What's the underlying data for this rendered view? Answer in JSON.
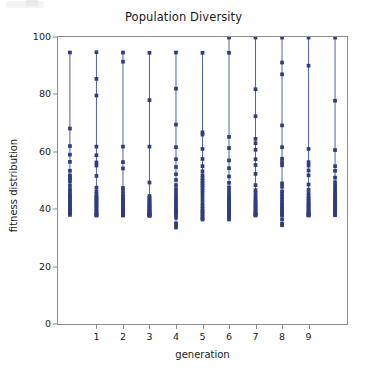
{
  "figure": {
    "width": 367,
    "height": 377,
    "background": "#ffffff",
    "axes_color": "#8c8c8c",
    "text_color": "#1a1a1a"
  },
  "chart_data": {
    "type": "scatter",
    "title": "Population Diversity",
    "xlabel": "generation",
    "ylabel": "fitness distribution",
    "xlim": [
      -0.45,
      10.45
    ],
    "ylim": [
      0,
      100
    ],
    "xticks": [
      1,
      2,
      3,
      4,
      5,
      6,
      7,
      8,
      9
    ],
    "xtick_labels": [
      "1",
      "2",
      "3",
      "4",
      "5",
      "6",
      "7",
      "8",
      "9"
    ],
    "yticks": [
      0,
      20,
      40,
      60,
      80,
      100
    ],
    "ytick_labels": [
      "0",
      "20",
      "40",
      "60",
      "80",
      "100"
    ],
    "grid": false,
    "legend": null,
    "marker_color": "#2f3d80",
    "line_color": "#42508f",
    "marker_size": 2.6,
    "line_width": 0.9,
    "note": "Each generation is drawn as a vertical stem connecting the minimum and maximum fitness, overlaid with one marker per individual in the population.",
    "series": [
      {
        "name": "generation 0",
        "x": 0,
        "clipped": true,
        "values": [
          94.6,
          68.1,
          62.0,
          59.0,
          56.5,
          53.4,
          51.8,
          51.0,
          50.4,
          49.6,
          48.2,
          47.0,
          46.1,
          45.2,
          44.6,
          44.0,
          43.4,
          42.8,
          42.1,
          41.5,
          41.0,
          40.4,
          39.8,
          39.2,
          38.6,
          38.0
        ]
      },
      {
        "name": "generation 1",
        "x": 1,
        "clipped": false,
        "values": [
          94.7,
          85.4,
          79.6,
          61.8,
          58.8,
          56.3,
          55.2,
          51.6,
          47.5,
          46.2,
          45.3,
          44.5,
          44.0,
          43.4,
          42.9,
          42.3,
          41.7,
          41.1,
          40.6,
          40.0,
          39.5,
          39.0,
          38.5,
          38.1,
          37.9,
          37.8
        ]
      },
      {
        "name": "generation 2",
        "x": 2,
        "clipped": false,
        "values": [
          94.6,
          91.4,
          61.8,
          56.4,
          54.2,
          47.4,
          46.3,
          45.2,
          44.4,
          43.8,
          43.2,
          42.6,
          42.1,
          41.6,
          41.1,
          40.6,
          40.2,
          39.8,
          39.4,
          39.0,
          38.7,
          38.4,
          38.2,
          38.0,
          37.9,
          37.8
        ]
      },
      {
        "name": "generation 3",
        "x": 3,
        "clipped": false,
        "values": [
          94.5,
          78.0,
          61.8,
          49.3,
          44.6,
          44.0,
          43.5,
          43.0,
          42.5,
          42.1,
          41.7,
          41.3,
          40.9,
          40.5,
          40.1,
          39.8,
          39.5,
          39.2,
          38.9,
          38.6,
          38.4,
          38.2,
          38.0,
          37.9,
          37.8,
          37.7
        ]
      },
      {
        "name": "generation 4",
        "x": 4,
        "clipped": false,
        "values": [
          94.6,
          82.0,
          69.5,
          61.6,
          57.4,
          54.7,
          52.2,
          50.2,
          48.4,
          47.0,
          45.7,
          44.6,
          43.6,
          42.8,
          42.0,
          41.3,
          40.6,
          40.0,
          39.5,
          39.0,
          38.5,
          38.1,
          37.0,
          35.1,
          34.4,
          33.6
        ]
      },
      {
        "name": "generation 5",
        "x": 5,
        "clipped": false,
        "values": [
          94.5,
          66.8,
          66.0,
          61.0,
          57.5,
          55.0,
          53.2,
          51.8,
          50.8,
          49.9,
          49.1,
          48.3,
          47.5,
          46.6,
          45.6,
          44.4,
          43.2,
          42.0,
          41.0,
          40.1,
          39.4,
          38.8,
          38.2,
          37.4,
          36.8,
          36.4
        ]
      },
      {
        "name": "generation 6",
        "x": 6,
        "clipped": false,
        "values": [
          99.8,
          94.5,
          65.2,
          61.3,
          57.0,
          54.3,
          51.4,
          49.2,
          47.6,
          46.4,
          45.4,
          44.5,
          43.8,
          43.1,
          42.5,
          41.9,
          41.3,
          40.8,
          40.2,
          39.7,
          39.2,
          38.7,
          38.2,
          37.6,
          37.0,
          36.4
        ]
      },
      {
        "name": "generation 7",
        "x": 7,
        "clipped": false,
        "values": [
          99.8,
          81.8,
          72.4,
          64.5,
          63.0,
          60.7,
          57.4,
          55.4,
          52.3,
          48.4,
          46.6,
          45.5,
          44.5,
          43.6,
          42.9,
          42.2,
          41.6,
          41.0,
          40.4,
          39.9,
          39.4,
          38.9,
          38.5,
          38.2,
          38.0,
          37.8
        ]
      },
      {
        "name": "generation 8",
        "x": 8,
        "clipped": false,
        "values": [
          99.8,
          91.1,
          87.0,
          69.2,
          61.6,
          57.6,
          56.4,
          55.3,
          49.0,
          47.8,
          46.2,
          45.2,
          44.3,
          43.4,
          42.5,
          41.7,
          41.0,
          40.3,
          39.7,
          39.1,
          38.6,
          38.2,
          37.9,
          36.5,
          35.0,
          34.4
        ]
      },
      {
        "name": "generation 9",
        "x": 9,
        "clipped": false,
        "values": [
          99.8,
          90.0,
          61.0,
          56.4,
          55.2,
          53.5,
          51.8,
          48.6,
          46.8,
          45.6,
          44.6,
          43.8,
          43.1,
          42.5,
          41.9,
          41.4,
          40.9,
          40.4,
          39.9,
          39.4,
          39.0,
          38.6,
          38.3,
          38.0,
          37.9,
          37.8
        ]
      },
      {
        "name": "generation 10",
        "x": 10,
        "clipped": true,
        "values": [
          99.8,
          77.8,
          60.6,
          55.0,
          53.4,
          51.0,
          49.4,
          48.2,
          47.2,
          46.3,
          45.5,
          44.8,
          44.1,
          43.5,
          42.9,
          42.3,
          41.8,
          41.3,
          40.8,
          40.3,
          39.9,
          39.5,
          39.1,
          38.7,
          38.3,
          37.9
        ]
      }
    ]
  }
}
